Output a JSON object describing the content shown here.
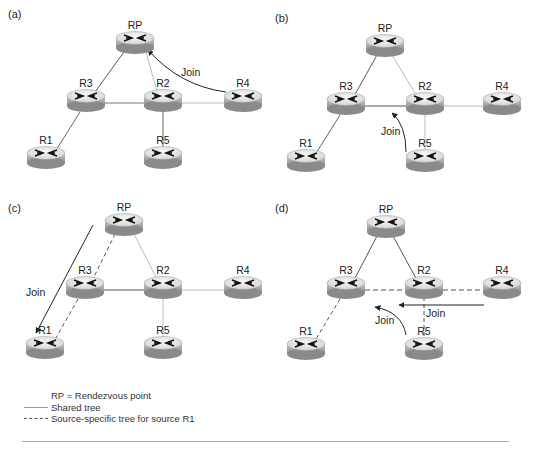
{
  "panels": [
    {
      "id": "a",
      "label": "(a)",
      "routers": {
        "RP": {
          "label": "RP",
          "x": 135,
          "y": 42
        },
        "R3": {
          "label": "R3",
          "x": 86,
          "y": 100
        },
        "R2": {
          "label": "R2",
          "x": 163,
          "y": 100
        },
        "R4": {
          "label": "R4",
          "x": 243,
          "y": 100
        },
        "R1": {
          "label": "R1",
          "x": 46,
          "y": 157
        },
        "R5": {
          "label": "R5",
          "x": 163,
          "y": 157
        }
      },
      "join_labels": [
        {
          "text": "Join",
          "x": 181,
          "y": 76
        }
      ]
    },
    {
      "id": "b",
      "label": "(b)",
      "routers": {
        "RP": {
          "label": "RP",
          "x": 385,
          "y": 45
        },
        "R3": {
          "label": "R3",
          "x": 346,
          "y": 103
        },
        "R2": {
          "label": "R2",
          "x": 425,
          "y": 103
        },
        "R4": {
          "label": "R4",
          "x": 502,
          "y": 103
        },
        "R1": {
          "label": "R1",
          "x": 306,
          "y": 160
        },
        "R5": {
          "label": "R5",
          "x": 425,
          "y": 160
        }
      },
      "join_labels": [
        {
          "text": "Join",
          "x": 381,
          "y": 135
        }
      ]
    },
    {
      "id": "c",
      "label": "(c)",
      "routers": {
        "RP": {
          "label": "RP",
          "x": 124,
          "y": 224
        },
        "R3": {
          "label": "R3",
          "x": 85,
          "y": 287
        },
        "R2": {
          "label": "R2",
          "x": 163,
          "y": 287
        },
        "R4": {
          "label": "R4",
          "x": 243,
          "y": 287
        },
        "R1": {
          "label": "R1",
          "x": 45,
          "y": 347
        },
        "R5": {
          "label": "R5",
          "x": 163,
          "y": 347
        }
      },
      "join_labels": [
        {
          "text": "Join",
          "x": 26,
          "y": 296
        }
      ]
    },
    {
      "id": "d",
      "label": "(d)",
      "routers": {
        "RP": {
          "label": "RP",
          "x": 386,
          "y": 226
        },
        "R3": {
          "label": "R3",
          "x": 346,
          "y": 287
        },
        "R2": {
          "label": "R2",
          "x": 424,
          "y": 287
        },
        "R4": {
          "label": "R4",
          "x": 502,
          "y": 287
        },
        "R1": {
          "label": "R1",
          "x": 306,
          "y": 348
        },
        "R5": {
          "label": "R5",
          "x": 424,
          "y": 348
        }
      },
      "join_labels": [
        {
          "text": "Join",
          "x": 426,
          "y": 317
        },
        {
          "text": "Join",
          "x": 375,
          "y": 324
        }
      ]
    }
  ],
  "legend": {
    "rp_def": "RP = Rendezvous point",
    "shared": "Shared tree",
    "source": "Source-specific tree for source R1"
  },
  "colors": {
    "line_dark": "#555555",
    "line_light": "#b0b0b0",
    "router_top": "#e6e6e6",
    "router_side": "#9a9a9a"
  }
}
